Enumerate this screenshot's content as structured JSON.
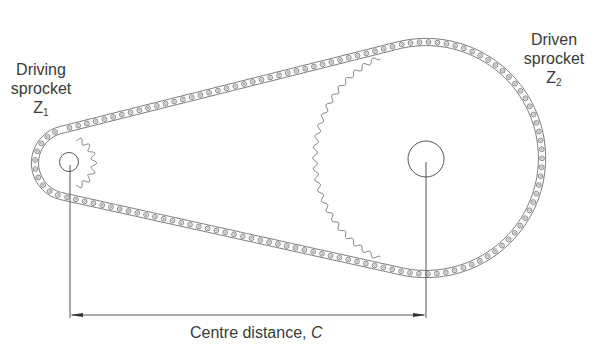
{
  "diagram": {
    "driving_sprocket": {
      "label_line1": "Driving",
      "label_line2": "sprocket",
      "symbol": "Z",
      "subscript": "1"
    },
    "driven_sprocket": {
      "label_line1": "Driven",
      "label_line2": "sprocket",
      "symbol": "Z",
      "subscript": "2"
    },
    "dimension": {
      "label": "Centre distance, ",
      "symbol": "C"
    },
    "colors": {
      "line": "#555555",
      "chain": "#666666",
      "text": "#3a3a3a",
      "background": "#ffffff"
    }
  }
}
